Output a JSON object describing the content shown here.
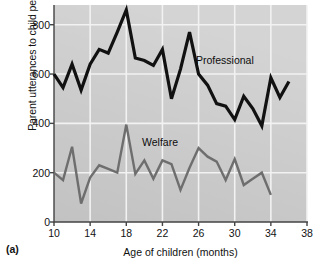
{
  "panel": {
    "tag": "(a)"
  },
  "chart_data": {
    "type": "line",
    "title": "",
    "xlabel": "Age of children (months)",
    "ylabel": "Parent utterances to child per hour",
    "xlim": [
      10,
      38
    ],
    "ylim": [
      0,
      880
    ],
    "xticks": [
      10,
      14,
      18,
      22,
      26,
      30,
      34,
      38
    ],
    "yticks": [
      0,
      200,
      400,
      600,
      800
    ],
    "grid": true,
    "legend_position": "inline-annotation",
    "plot_background": "#c2c2c2",
    "gridline_color": "#f2f2f2",
    "x": [
      10,
      11,
      12,
      13,
      14,
      15,
      16,
      17,
      18,
      19,
      20,
      21,
      22,
      23,
      24,
      25,
      26,
      27,
      28,
      29,
      30,
      31,
      32,
      33,
      34,
      35,
      36
    ],
    "series": [
      {
        "name": "Professional",
        "color": "#111111",
        "line_width": 3.2,
        "values": [
          600,
          545,
          640,
          535,
          640,
          700,
          685,
          770,
          860,
          665,
          655,
          635,
          700,
          500,
          620,
          770,
          600,
          555,
          480,
          470,
          415,
          510,
          460,
          390,
          585,
          505,
          570
        ]
      },
      {
        "name": "Welfare",
        "color": "#6e6e6e",
        "line_width": 2.4,
        "values": [
          200,
          170,
          305,
          75,
          180,
          230,
          215,
          200,
          395,
          195,
          250,
          175,
          250,
          235,
          130,
          220,
          300,
          265,
          245,
          170,
          255,
          150,
          175,
          200,
          110,
          null,
          null
        ]
      }
    ],
    "annotations": [
      {
        "text": "Professional",
        "x_px": 196,
        "y_px": 54
      },
      {
        "text": "Welfare",
        "x_px": 142,
        "y_px": 136
      }
    ]
  }
}
